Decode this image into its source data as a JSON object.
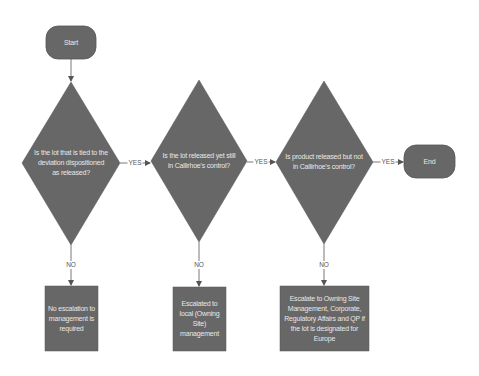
{
  "colors": {
    "shape_fill": "#676767",
    "shape_stroke": "#555555",
    "text": "#e8e8e8",
    "connector": "#555555",
    "background": "#ffffff"
  },
  "nodes": {
    "start": {
      "type": "terminator",
      "label": "Start"
    },
    "decision1": {
      "type": "decision",
      "label": "Is the lot that is tied to the deviation dispositioned as released?"
    },
    "decision2": {
      "type": "decision",
      "label": "Is the lot released yet still in Callirhoe's control?"
    },
    "decision3": {
      "type": "decision",
      "label": "Is product released but not in Callirhoe's control?"
    },
    "end": {
      "type": "terminator",
      "label": "End"
    },
    "outcome1": {
      "type": "process",
      "label": "No escalation to management is required"
    },
    "outcome2": {
      "type": "process",
      "label": "Escalated to local (Owning Site) management"
    },
    "outcome3": {
      "type": "process",
      "label": "Escalate to Owning Site Management, Corporate, Regulatory Affairs and QP if the lot is designated for Europe"
    }
  },
  "edges": [
    {
      "from": "start",
      "to": "decision1",
      "label": ""
    },
    {
      "from": "decision1",
      "to": "decision2",
      "label": "YES"
    },
    {
      "from": "decision2",
      "to": "decision3",
      "label": "YES"
    },
    {
      "from": "decision3",
      "to": "end",
      "label": "YES"
    },
    {
      "from": "decision1",
      "to": "outcome1",
      "label": "NO"
    },
    {
      "from": "decision2",
      "to": "outcome2",
      "label": "NO"
    },
    {
      "from": "decision3",
      "to": "outcome3",
      "label": "NO"
    }
  ]
}
